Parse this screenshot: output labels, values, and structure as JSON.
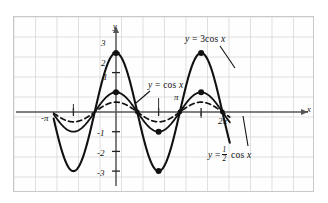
{
  "figure": {
    "background": "#ffffff",
    "grid_color": "#d3d3d3",
    "curve_color": "#111111",
    "axis_color": "#555555"
  },
  "axes": {
    "x_axis_label": "x",
    "y_axis_label": "y",
    "x_ticks": [
      {
        "label": "-π",
        "value": -3.14159
      },
      {
        "label": "π",
        "value": 3.14159
      },
      {
        "label": "2π",
        "value": 6.28319
      }
    ],
    "y_ticks": [
      {
        "label": "3",
        "value": 3
      },
      {
        "label": "2",
        "value": 2
      },
      {
        "label": "1",
        "value": 1
      },
      {
        "label": "-1",
        "value": -1
      },
      {
        "label": "-2",
        "value": -2
      },
      {
        "label": "-3",
        "value": -3
      }
    ],
    "xlim": [
      -4.6,
      8.4
    ],
    "ylim": [
      -3.8,
      3.8
    ]
  },
  "labels": {
    "curve_3cos": {
      "lhs": "y",
      "eq": "=",
      "rhs_coef": "3",
      "rhs_fn": "cos",
      "rhs_var": "x"
    },
    "curve_cos": {
      "lhs": "y",
      "eq": "=",
      "rhs_fn": "cos",
      "rhs_var": "x"
    },
    "curve_halfcos": {
      "lhs": "y",
      "eq": "=",
      "num": "1",
      "den": "2",
      "rhs_fn": "cos",
      "rhs_var": "x"
    }
  },
  "chart_data": {
    "type": "line",
    "xlabel": "x",
    "ylabel": "y",
    "xlim": [
      -4.6,
      8.4
    ],
    "ylim": [
      -3.8,
      3.8
    ],
    "grid": true,
    "legend": "inline-annotations",
    "xticks": [
      -3.14159,
      3.14159,
      6.28319
    ],
    "xticklabels": [
      "-π",
      "π",
      "2π"
    ],
    "yticks": [
      3,
      2,
      1,
      -1,
      -2,
      -3
    ],
    "yticklabels": [
      "3",
      "2",
      "1",
      "-1",
      "-2",
      "-3"
    ],
    "series": [
      {
        "name": "y = 3 cos x",
        "amplitude": 3,
        "style": "solid",
        "linewidth": 2.1,
        "x": [
          -4.6,
          -4.0,
          -3.5,
          -3.14159,
          -2.5,
          -2.0,
          -1.5708,
          -1.0,
          -0.5,
          0,
          0.5,
          1.0,
          1.5708,
          2.0,
          2.5,
          3.14159,
          3.5,
          4.0,
          4.71239,
          5.0,
          5.5,
          6.0,
          6.28319,
          6.8,
          7.4,
          8.0,
          8.4
        ],
        "y": [
          -0.345,
          -1.961,
          -2.809,
          -3.0,
          -2.403,
          -1.248,
          0,
          1.621,
          2.633,
          3.0,
          2.633,
          1.621,
          0,
          -1.248,
          -2.403,
          -3.0,
          -2.809,
          -1.961,
          0,
          0.851,
          2.127,
          2.881,
          3.0,
          2.627,
          1.336,
          -0.436,
          -1.529
        ]
      },
      {
        "name": "y = cos x",
        "amplitude": 1,
        "style": "solid",
        "linewidth": 1.8,
        "x": [
          -4.6,
          -4.0,
          -3.5,
          -3.14159,
          -2.5,
          -2.0,
          -1.5708,
          -1.0,
          -0.5,
          0,
          0.5,
          1.0,
          1.5708,
          2.0,
          2.5,
          3.14159,
          3.5,
          4.0,
          4.71239,
          5.0,
          5.5,
          6.0,
          6.28319,
          6.8,
          7.4,
          8.0,
          8.4
        ],
        "y": [
          -0.115,
          -0.654,
          -0.936,
          -1.0,
          -0.801,
          -0.416,
          0,
          0.54,
          0.878,
          1.0,
          0.878,
          0.54,
          0,
          -0.416,
          -0.801,
          -1.0,
          -0.936,
          -0.654,
          0,
          0.284,
          0.709,
          0.96,
          1.0,
          0.876,
          0.445,
          -0.145,
          -0.51
        ]
      },
      {
        "name": "y = 1/2 cos x",
        "amplitude": 0.5,
        "style": "dashed",
        "linewidth": 1.7,
        "x": [
          -4.6,
          -4.0,
          -3.5,
          -3.14159,
          -2.5,
          -2.0,
          -1.5708,
          -1.0,
          -0.5,
          0,
          0.5,
          1.0,
          1.5708,
          2.0,
          2.5,
          3.14159,
          3.5,
          4.0,
          4.71239,
          5.0,
          5.5,
          6.0,
          6.28319,
          6.8,
          7.4,
          8.0,
          8.4
        ],
        "y": [
          -0.057,
          -0.327,
          -0.468,
          -0.5,
          -0.4,
          -0.208,
          0,
          0.27,
          0.439,
          0.5,
          0.439,
          0.27,
          0,
          -0.208,
          -0.4,
          -0.5,
          -0.468,
          -0.327,
          0,
          0.142,
          0.355,
          0.48,
          0.5,
          0.438,
          0.223,
          -0.073,
          -0.255
        ]
      }
    ],
    "marked_points": [
      {
        "x": 0,
        "y": 3,
        "series": "y = 3 cos x"
      },
      {
        "x": 0,
        "y": 1,
        "series": "y = cos x"
      },
      {
        "x": 3.14159,
        "y": -3,
        "series": "y = 3 cos x"
      },
      {
        "x": 3.14159,
        "y": -1,
        "series": "y = cos x"
      },
      {
        "x": 6.28319,
        "y": 3,
        "series": "y = 3 cos x"
      },
      {
        "x": 6.28319,
        "y": 1,
        "series": "y = cos x"
      },
      {
        "x": 1.5708,
        "y": 0,
        "series": "all"
      },
      {
        "x": 4.71239,
        "y": 0,
        "series": "all"
      },
      {
        "x": 7.85398,
        "y": 0,
        "series": "all"
      }
    ]
  }
}
